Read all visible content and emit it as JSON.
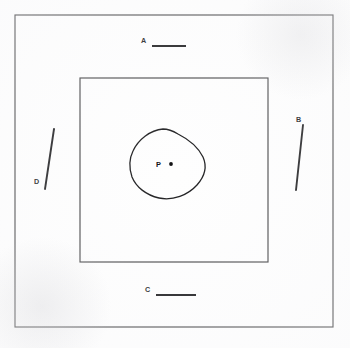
{
  "figure": {
    "background_color": "#fefefe",
    "line_color": "#1d1d1f",
    "frame_color": "#3a3a3c",
    "width": 350,
    "height": 348
  },
  "labels": {
    "a": "A",
    "b": "B",
    "c": "C",
    "d": "D",
    "p": "P"
  },
  "elements": {
    "outer_rectangle": {
      "name": "outer-boundary",
      "x": 15,
      "y": 15,
      "width": 318,
      "height": 312
    },
    "inner_rectangle": {
      "name": "inner-boundary",
      "x": 80,
      "y": 78,
      "width": 188,
      "height": 184
    },
    "closed_curve": {
      "name": "interior-region",
      "center_x": 167,
      "center_y": 164,
      "apex_x": 163,
      "apex_y": 129,
      "left_x": 130,
      "right_x": 205,
      "bottom_y": 198
    },
    "point_p": {
      "name": "point-p",
      "x": 171,
      "y": 164
    }
  },
  "pointers": [
    {
      "id": "a",
      "label": "A",
      "orientation": "horizontal",
      "label_x": 143,
      "label_y": 42,
      "x1": 152,
      "y1": 46,
      "x2": 186,
      "y2": 46
    },
    {
      "id": "b",
      "label": "B",
      "orientation": "vertical",
      "label_x": 299,
      "label_y": 122,
      "x1": 303,
      "y1": 125,
      "x2": 296,
      "y2": 190
    },
    {
      "id": "c",
      "label": "C",
      "orientation": "horizontal",
      "label_x": 148,
      "label_y": 292,
      "x1": 156,
      "y1": 295,
      "x2": 196,
      "y2": 295
    },
    {
      "id": "d",
      "label": "D",
      "orientation": "diagonal",
      "label_x": 37,
      "label_y": 182,
      "x1": 54,
      "y1": 129,
      "x2": 45,
      "y2": 189
    }
  ]
}
